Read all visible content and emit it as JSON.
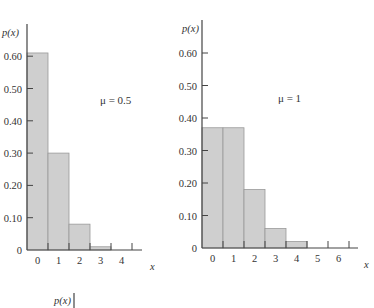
{
  "chart_data": [
    {
      "type": "bar",
      "title": "",
      "annotation": "μ = 0.5",
      "xlabel": "x",
      "ylabel": "p(x)",
      "categories": [
        "0",
        "1",
        "2",
        "3",
        "4"
      ],
      "values": [
        0.61,
        0.3,
        0.08,
        0.01,
        0.0
      ],
      "ylim": [
        0,
        0.65
      ],
      "yticks": [
        "0",
        "0.10",
        "0.20",
        "0.30",
        "0.40",
        "0.50",
        "0.60"
      ],
      "ytick_values": [
        0,
        0.1,
        0.2,
        0.3,
        0.4,
        0.5,
        0.6
      ],
      "grid": false
    },
    {
      "type": "bar",
      "title": "",
      "annotation": "μ = 1",
      "xlabel": "x",
      "ylabel": "p(x)",
      "categories": [
        "0",
        "1",
        "2",
        "3",
        "4",
        "5",
        "6"
      ],
      "values": [
        0.37,
        0.37,
        0.18,
        0.06,
        0.02,
        0.0,
        0.0
      ],
      "ylim": [
        0,
        0.65
      ],
      "yticks": [
        "0",
        "0.10",
        "0.20",
        "0.30",
        "0.40",
        "0.50",
        "0.60"
      ],
      "ytick_values": [
        0,
        0.1,
        0.2,
        0.3,
        0.4,
        0.5,
        0.6
      ],
      "grid": false
    }
  ],
  "partial_third_chart": {
    "ylabel": "p(x)"
  }
}
